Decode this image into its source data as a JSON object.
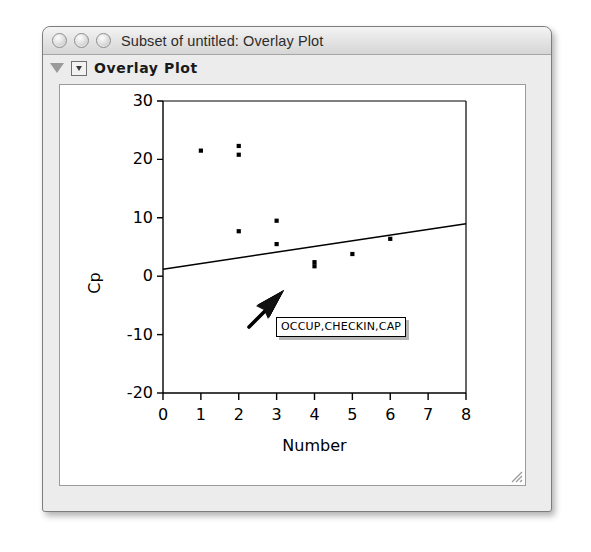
{
  "window": {
    "title": "Subset of untitled: Overlay Plot",
    "buttons": [
      {
        "name": "close-button",
        "label": "Close"
      },
      {
        "name": "minimize-button",
        "label": "Minimize"
      },
      {
        "name": "zoom-button",
        "label": "Zoom"
      }
    ]
  },
  "outline": {
    "label": "Overlay Plot",
    "disclosure_state": "expanded"
  },
  "tooltip": {
    "text": "OCCUP,CHECKIN,CAP"
  },
  "cursor": {
    "type": "arrow-pointer"
  },
  "colors": {
    "window_bg": "#ececec",
    "titlebar_top": "#f4f4f4",
    "titlebar_bottom": "#d6d6d6",
    "plot_bg": "#ffffff",
    "axis": "#000000",
    "point": "#000000",
    "line": "#000000",
    "tooltip_border": "#000000"
  },
  "chart_data": {
    "type": "scatter",
    "title": "Overlay Plot",
    "xlabel": "Number",
    "ylabel": "Cp",
    "xlim": [
      0,
      8
    ],
    "ylim": [
      -20,
      30
    ],
    "xticks": [
      0,
      1,
      2,
      3,
      4,
      5,
      6,
      7,
      8
    ],
    "yticks": [
      -20,
      -10,
      0,
      10,
      20,
      30
    ],
    "grid": false,
    "legend": false,
    "points": [
      {
        "x": 1,
        "y": 21.5
      },
      {
        "x": 2,
        "y": 22.3
      },
      {
        "x": 2,
        "y": 20.8
      },
      {
        "x": 2,
        "y": 7.7
      },
      {
        "x": 3,
        "y": 9.5
      },
      {
        "x": 3,
        "y": 5.5
      },
      {
        "x": 4,
        "y": 2.4
      },
      {
        "x": 4,
        "y": 1.7
      },
      {
        "x": 5,
        "y": 3.8
      },
      {
        "x": 6,
        "y": 6.4
      }
    ],
    "series": [
      {
        "name": "Cp",
        "x": [
          1,
          2,
          2,
          2,
          3,
          3,
          4,
          4,
          5,
          6
        ],
        "values": [
          21.5,
          22.3,
          20.8,
          7.7,
          9.5,
          5.5,
          2.4,
          1.7,
          3.8,
          6.4
        ]
      }
    ],
    "reference_line": {
      "name": "Cp = p line",
      "x": [
        0,
        8
      ],
      "y": [
        1.2,
        9.0
      ]
    }
  }
}
